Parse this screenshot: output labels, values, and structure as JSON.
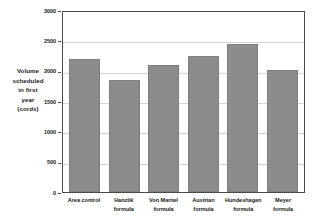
{
  "chart_data": {
    "type": "bar",
    "title": "",
    "subtitle": "",
    "xlabel": "",
    "ylabel": "Volume scheduled in first year (cords)",
    "ylabel_lines": [
      "Volume",
      "scheduled",
      "in first",
      "year",
      "(cords)"
    ],
    "categories": [
      "Area control",
      "Hanzlik formula",
      "Von Mantel formula",
      "Austrian formula",
      "Hundeshagen formula",
      "Meyer formula"
    ],
    "category_lines": [
      [
        "Area control"
      ],
      [
        "Hanzlik",
        "formula"
      ],
      [
        "Von Mantel",
        "formula"
      ],
      [
        "Austrian",
        "formula"
      ],
      [
        "Hundeshagen",
        "formula"
      ],
      [
        "Meyer",
        "formula"
      ]
    ],
    "values": [
      2200,
      1840,
      2090,
      2250,
      2440,
      2010
    ],
    "ylim": [
      0,
      3000
    ],
    "yticks": [
      0,
      500,
      1000,
      1500,
      2000,
      2500,
      3000
    ],
    "ytick_labels": [
      "0",
      "500",
      "1000",
      "1500",
      "2000",
      "2500",
      "3000"
    ],
    "grid": true,
    "grid_axis": "y",
    "legend": false,
    "legend_position": "none",
    "bar_color": "#8c8c8c",
    "bar_border_color": "#7d7d7d",
    "grid_color": "#d2d2d2",
    "axis_color": "#4a4a4a",
    "text_color": "#1a1a1a",
    "background_color": "#ffffff"
  }
}
